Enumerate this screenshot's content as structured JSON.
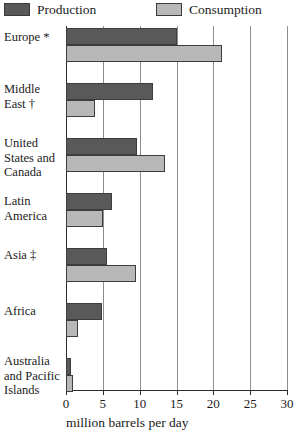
{
  "legend": {
    "entries": [
      {
        "label": "Production",
        "swatch": "dark-gray-swatch",
        "color": "#595959"
      },
      {
        "label": "Consumption",
        "swatch": "light-gray-swatch",
        "color": "#b8b8b8"
      }
    ]
  },
  "axis": {
    "title": "million barrels per day",
    "ticks": [
      "0",
      "5",
      "10",
      "15",
      "20",
      "25",
      "30"
    ]
  },
  "categories": [
    {
      "label": "Europe *"
    },
    {
      "label": "Middle\nEast †"
    },
    {
      "label": "United\nStates and\nCanada"
    },
    {
      "label": "Latin\nAmerica"
    },
    {
      "label": "Asia ‡"
    },
    {
      "label": "Africa"
    },
    {
      "label": "Australia\nand Pacific\nIslands"
    }
  ],
  "chart_data": {
    "type": "bar",
    "orientation": "horizontal",
    "title": "",
    "xlabel": "million barrels per day",
    "ylabel": "",
    "xlim": [
      0,
      30
    ],
    "xticks": [
      0,
      5,
      10,
      15,
      20,
      25,
      30
    ],
    "grid": true,
    "legend_position": "top",
    "categories": [
      "Europe *",
      "Middle East †",
      "United States and Canada",
      "Latin America",
      "Asia ‡",
      "Africa",
      "Australia and Pacific Islands"
    ],
    "series": [
      {
        "name": "Production",
        "color": "#595959",
        "values": [
          15.1,
          11.8,
          9.7,
          6.2,
          5.5,
          4.9,
          0.7
        ]
      },
      {
        "name": "Consumption",
        "color": "#b8b8b8",
        "values": [
          21.2,
          4.0,
          13.5,
          5.0,
          9.5,
          1.6,
          0.9
        ]
      }
    ]
  }
}
